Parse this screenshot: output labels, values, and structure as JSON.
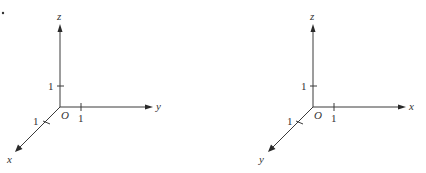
{
  "figure": {
    "marker_dot": "•",
    "left_diagram": {
      "origin_label": "O",
      "axes": {
        "z": {
          "label": "z",
          "tick_label": "1"
        },
        "y": {
          "label": "y",
          "tick_label": "1"
        },
        "x": {
          "label": "x",
          "tick_label": "1"
        }
      },
      "handedness": "right-handed (x toward viewer, y to the right, z up)"
    },
    "right_diagram": {
      "origin_label": "O",
      "axes": {
        "z": {
          "label": "z",
          "tick_label": "1"
        },
        "x": {
          "label": "x",
          "tick_label": "1"
        },
        "y": {
          "label": "y",
          "tick_label": "1"
        }
      },
      "handedness": "left-handed (y toward viewer, x to the right, z up)"
    },
    "colors": {
      "line": "#3a3a3a",
      "text": "#333333",
      "background": "#ffffff"
    }
  }
}
